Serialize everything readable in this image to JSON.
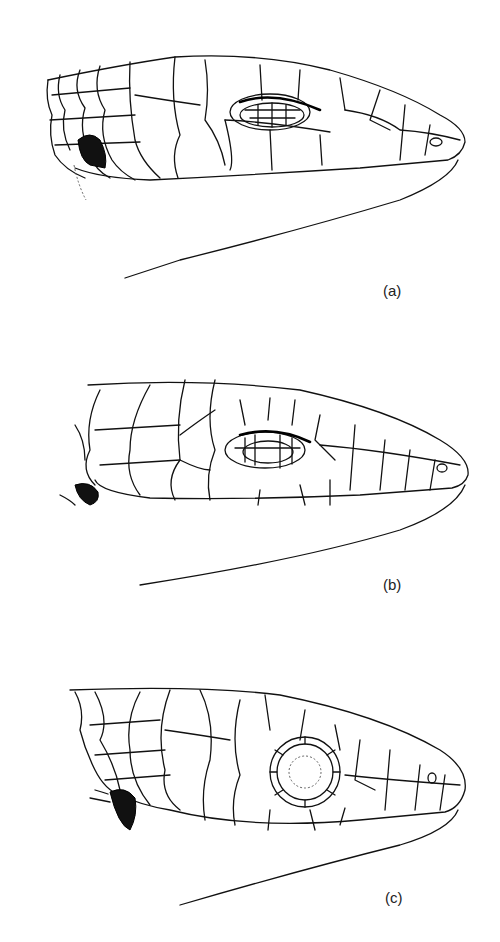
{
  "figure": {
    "panels": [
      {
        "id": "a",
        "label": "(a)",
        "eye": "closed-scaly-lid"
      },
      {
        "id": "b",
        "label": "(b)",
        "eye": "lid-with-window"
      },
      {
        "id": "c",
        "label": "(c)",
        "eye": "spectacle"
      }
    ]
  },
  "colors": {
    "line": "#111111",
    "background": "#ffffff"
  }
}
